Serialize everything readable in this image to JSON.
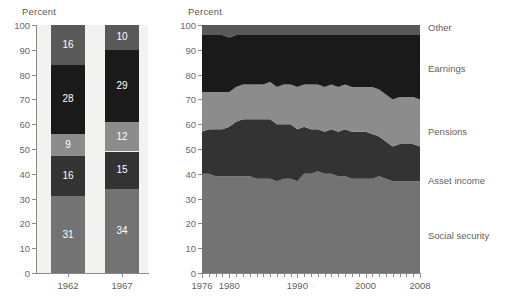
{
  "chart_data": [
    {
      "type": "bar",
      "title": "",
      "ylabel": "Percent",
      "xlabel": "",
      "ylim": [
        0,
        100
      ],
      "yticks": [
        0,
        10,
        20,
        30,
        40,
        50,
        60,
        70,
        80,
        90,
        100
      ],
      "grid": false,
      "stacked": true,
      "categories": [
        "1962",
        "1967"
      ],
      "series": [
        {
          "name": "Social security",
          "color": "#737373",
          "values": [
            31,
            34
          ]
        },
        {
          "name": "Asset income",
          "color": "#333333",
          "values": [
            16,
            15
          ]
        },
        {
          "name": "Pensions",
          "color": "#8c8c8c",
          "values": [
            9,
            12
          ]
        },
        {
          "name": "Earnings",
          "color": "#1a1a1a",
          "values": [
            28,
            29
          ]
        },
        {
          "name": "Other",
          "color": "#595959",
          "values": [
            16,
            10
          ]
        }
      ],
      "data_labels": {
        "1962": {
          "Social security": "31",
          "Asset income": "16",
          "Pensions": "9",
          "Earnings": "28",
          "Other": "16"
        },
        "1967": {
          "Social security": "34",
          "Asset income": "15",
          "Pensions": "12",
          "Earnings": "29",
          "Other": "10"
        }
      }
    },
    {
      "type": "area",
      "title": "",
      "ylabel": "Percent",
      "xlabel": "",
      "ylim": [
        0,
        100
      ],
      "yticks": [
        0,
        10,
        20,
        30,
        40,
        50,
        60,
        70,
        80,
        90,
        100
      ],
      "xlim": [
        1976,
        2008
      ],
      "xticks": [
        1976,
        1977,
        1978,
        1979,
        1980,
        1981,
        1982,
        1983,
        1984,
        1985,
        1986,
        1987,
        1988,
        1989,
        1990,
        1991,
        1992,
        1993,
        1994,
        1995,
        1996,
        1997,
        1998,
        1999,
        2000,
        2001,
        2002,
        2003,
        2004,
        2005,
        2006,
        2007,
        2008
      ],
      "xticklabels": [
        "1976",
        "1980",
        "1990",
        "2000",
        "2008"
      ],
      "xticklabel_values": [
        1976,
        1980,
        1990,
        2000,
        2008
      ],
      "grid": false,
      "stacked": true,
      "legend_position": "right",
      "x": [
        1976,
        1977,
        1978,
        1979,
        1980,
        1981,
        1982,
        1983,
        1984,
        1985,
        1986,
        1987,
        1988,
        1989,
        1990,
        1991,
        1992,
        1993,
        1994,
        1995,
        1996,
        1997,
        1998,
        1999,
        2000,
        2001,
        2002,
        2003,
        2004,
        2005,
        2006,
        2007,
        2008
      ],
      "series": [
        {
          "name": "Social security",
          "color": "#737373",
          "values": [
            40,
            40,
            39,
            39,
            39,
            39,
            39,
            39,
            38,
            38,
            38,
            37,
            38,
            38,
            37,
            40,
            40,
            41,
            40,
            40,
            39,
            39,
            38,
            38,
            38,
            38,
            39,
            38,
            37,
            37,
            37,
            37,
            37
          ]
        },
        {
          "name": "Asset income",
          "color": "#333333",
          "values": [
            17,
            18,
            19,
            19,
            20,
            22,
            23,
            23,
            24,
            24,
            24,
            23,
            22,
            22,
            21,
            19,
            18,
            17,
            17,
            18,
            18,
            19,
            19,
            19,
            19,
            18,
            16,
            15,
            14,
            15,
            15,
            15,
            14
          ]
        },
        {
          "name": "Pensions",
          "color": "#8c8c8c",
          "values": [
            16,
            15,
            15,
            15,
            14,
            14,
            14,
            14,
            14,
            14,
            15,
            15,
            16,
            16,
            17,
            17,
            18,
            18,
            18,
            18,
            18,
            18,
            18,
            18,
            18,
            19,
            19,
            19,
            19,
            19,
            19,
            19,
            19
          ]
        },
        {
          "name": "Earnings",
          "color": "#1a1a1a",
          "values": [
            23,
            23,
            23,
            23,
            22,
            21,
            20,
            20,
            20,
            20,
            19,
            21,
            20,
            20,
            21,
            20,
            20,
            20,
            21,
            20,
            21,
            20,
            21,
            21,
            21,
            21,
            22,
            24,
            26,
            25,
            25,
            25,
            26
          ]
        },
        {
          "name": "Other",
          "color": "#595959",
          "values": [
            4,
            4,
            4,
            4,
            5,
            4,
            4,
            4,
            4,
            4,
            4,
            4,
            4,
            4,
            4,
            4,
            4,
            4,
            4,
            4,
            4,
            4,
            4,
            4,
            4,
            4,
            4,
            4,
            4,
            4,
            4,
            4,
            4
          ]
        }
      ]
    }
  ],
  "bar_chart": {
    "ylabel": "Percent",
    "yticks": [
      "100",
      "90",
      "80",
      "70",
      "60",
      "50",
      "40",
      "30",
      "20",
      "10",
      "0"
    ],
    "xlabels": [
      "1962",
      "1967"
    ]
  },
  "area_chart": {
    "ylabel": "Percent",
    "yticks": [
      "100",
      "90",
      "80",
      "70",
      "60",
      "50",
      "40",
      "30",
      "20",
      "10",
      "0"
    ],
    "xlabels": [
      "1976",
      "1980",
      "1990",
      "2000",
      "2008"
    ]
  },
  "legend": {
    "items": [
      {
        "label": "Other",
        "color": "#595959"
      },
      {
        "label": "Earnings",
        "color": "#1a1a1a"
      },
      {
        "label": "Pensions",
        "color": "#8c8c8c"
      },
      {
        "label": "Asset income",
        "color": "#333333"
      },
      {
        "label": "Social security",
        "color": "#737373"
      }
    ]
  }
}
